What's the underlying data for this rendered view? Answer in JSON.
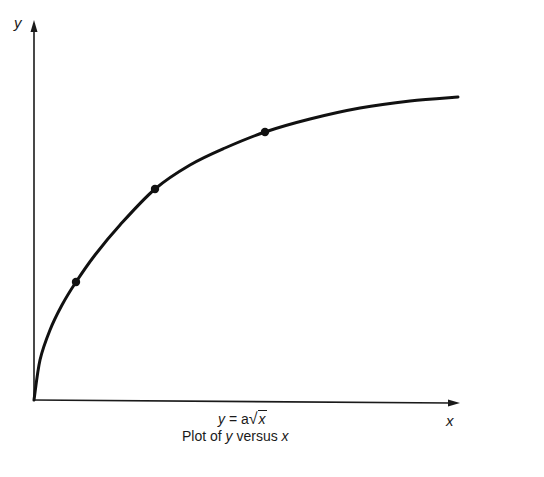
{
  "chart_data": {
    "type": "line",
    "title": "Plot of y versus x",
    "equation": "y = a√x",
    "xlabel": "x",
    "ylabel": "y",
    "grid": false,
    "legend": null,
    "series": [
      {
        "name": "y = a√x",
        "x": [
          0,
          1,
          4,
          9,
          16,
          25,
          36,
          49
        ],
        "y": [
          0,
          1,
          2,
          3,
          4,
          5,
          6,
          7
        ]
      }
    ],
    "marked_points": [
      {
        "x": 1,
        "y": 1
      },
      {
        "x": 4,
        "y": 2
      },
      {
        "x": 9,
        "y": 3
      }
    ]
  },
  "labels": {
    "y_axis": "y",
    "x_axis": "x",
    "equation_lhs": "y",
    "equation_mid": " = a",
    "equation_rad": "x",
    "caption_pre": "Plot of ",
    "caption_y": "y",
    "caption_mid": " versus ",
    "caption_x": "x"
  },
  "colors": {
    "ink": "#1a1a1a",
    "background": "#ffffff"
  }
}
